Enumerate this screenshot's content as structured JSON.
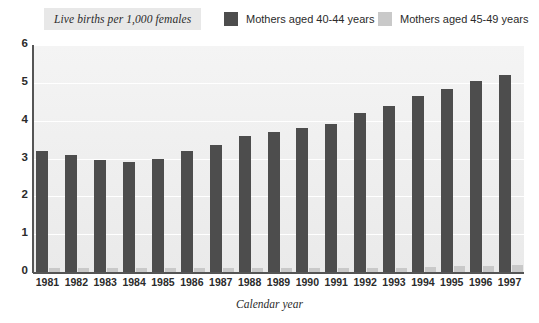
{
  "chart_title": "Live births per 1,000 females",
  "legend": {
    "entries": [
      {
        "label": "Mothers aged 40-44 years",
        "color": "#4d4d4d",
        "swatch_name": "legend-swatch-dark"
      },
      {
        "label": "Mothers aged 45-49 years",
        "color": "#c9c9c9",
        "swatch_name": "legend-swatch-light"
      }
    ]
  },
  "axis": {
    "x_title": "Calendar year",
    "y_tick_labels": [
      "6",
      "5",
      "4",
      "3",
      "2",
      "1",
      "0"
    ],
    "x_tick_labels": [
      "1981",
      "1982",
      "1983",
      "1984",
      "1985",
      "1986",
      "1987",
      "1988",
      "1989",
      "1990",
      "1991",
      "1992",
      "1993",
      "1994",
      "1995",
      "1996",
      "1997"
    ]
  },
  "colors": {
    "plot_background": "#efefef",
    "gridline": "#ffffff",
    "axis": "#555555",
    "title_band": "#e8e8e8",
    "series_40_44": "#4d4d4d",
    "series_45_49": "#c9c9c9",
    "text": "#2b2b2b"
  },
  "chart_data": {
    "type": "bar",
    "title": "Live births per 1,000 females",
    "subtitle": "",
    "xlabel": "Calendar year",
    "ylabel": "Live births per 1,000 females",
    "ylim": [
      0,
      6
    ],
    "ytick_step": 1,
    "grid": true,
    "legend_position": "top",
    "categories": [
      "1981",
      "1982",
      "1983",
      "1984",
      "1985",
      "1986",
      "1987",
      "1988",
      "1989",
      "1990",
      "1991",
      "1992",
      "1993",
      "1994",
      "1995",
      "1996",
      "1997"
    ],
    "series": [
      {
        "name": "Mothers aged 40-44 years",
        "color": "#4d4d4d",
        "values": [
          3.2,
          3.1,
          2.95,
          2.9,
          3.0,
          3.2,
          3.35,
          3.6,
          3.7,
          3.8,
          3.9,
          4.2,
          4.4,
          4.65,
          4.85,
          5.05,
          5.2
        ]
      },
      {
        "name": "Mothers aged 45-49 years",
        "color": "#c9c9c9",
        "values": [
          0.1,
          0.1,
          0.1,
          0.1,
          0.1,
          0.1,
          0.1,
          0.1,
          0.1,
          0.1,
          0.1,
          0.1,
          0.1,
          0.12,
          0.15,
          0.15,
          0.18
        ]
      }
    ]
  }
}
